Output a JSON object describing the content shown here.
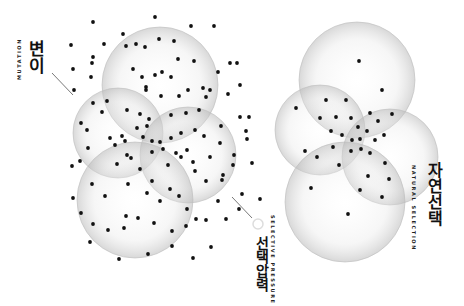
{
  "labels": {
    "mutation": {
      "ko": "변이",
      "en": "MUTATION"
    },
    "selective_pressure": {
      "ko": "선택압력",
      "en": "SELECTIVE PRESSURE"
    },
    "natural_selection": {
      "ko": "자연선택",
      "en": "NATURAL SELECTION"
    }
  },
  "colors": {
    "dot": "#111111",
    "bubble_edge": "#bdbdbd",
    "bubble_fill": "#f2f2f2",
    "leader": "#555555"
  },
  "left_cluster": {
    "circles": [
      {
        "cx": 160,
        "cy": 85,
        "r": 58
      },
      {
        "cx": 118,
        "cy": 133,
        "r": 45
      },
      {
        "cx": 188,
        "cy": 155,
        "r": 48
      },
      {
        "cx": 135,
        "cy": 200,
        "r": 58
      }
    ],
    "dots": [
      [
        93,
        22
      ],
      [
        155,
        17
      ],
      [
        123,
        34
      ],
      [
        104,
        44
      ],
      [
        71,
        45
      ],
      [
        191,
        26
      ],
      [
        214,
        26
      ],
      [
        93,
        57
      ],
      [
        126,
        46
      ],
      [
        73,
        69
      ],
      [
        92,
        63
      ],
      [
        136,
        44
      ],
      [
        145,
        47
      ],
      [
        159,
        39
      ],
      [
        174,
        41
      ],
      [
        178,
        59
      ],
      [
        194,
        61
      ],
      [
        230,
        63
      ],
      [
        237,
        63
      ],
      [
        91,
        77
      ],
      [
        74,
        90
      ],
      [
        142,
        77
      ],
      [
        133,
        69
      ],
      [
        146,
        87
      ],
      [
        155,
        75
      ],
      [
        162,
        72
      ],
      [
        171,
        77
      ],
      [
        218,
        72
      ],
      [
        240,
        85
      ],
      [
        93,
        103
      ],
      [
        107,
        101
      ],
      [
        146,
        90
      ],
      [
        161,
        96
      ],
      [
        179,
        96
      ],
      [
        188,
        90
      ],
      [
        203,
        88
      ],
      [
        210,
        90
      ],
      [
        228,
        94
      ],
      [
        81,
        123
      ],
      [
        102,
        112
      ],
      [
        127,
        110
      ],
      [
        140,
        114
      ],
      [
        149,
        119
      ],
      [
        171,
        115
      ],
      [
        186,
        113
      ],
      [
        199,
        110
      ],
      [
        206,
        97
      ],
      [
        110,
        138
      ],
      [
        122,
        136
      ],
      [
        143,
        137
      ],
      [
        152,
        141
      ],
      [
        171,
        138
      ],
      [
        181,
        133
      ],
      [
        195,
        130
      ],
      [
        204,
        136
      ],
      [
        221,
        126
      ],
      [
        240,
        117
      ],
      [
        249,
        117
      ],
      [
        246,
        131
      ],
      [
        87,
        130
      ],
      [
        88,
        148
      ],
      [
        137,
        128
      ],
      [
        147,
        126
      ],
      [
        115,
        145
      ],
      [
        125,
        141
      ],
      [
        127,
        155
      ],
      [
        160,
        142
      ],
      [
        163,
        149
      ],
      [
        176,
        153
      ],
      [
        187,
        150
      ],
      [
        193,
        162
      ],
      [
        210,
        157
      ],
      [
        220,
        143
      ],
      [
        234,
        155
      ],
      [
        80,
        161
      ],
      [
        72,
        166
      ],
      [
        117,
        164
      ],
      [
        131,
        158
      ],
      [
        140,
        169
      ],
      [
        152,
        152
      ],
      [
        168,
        165
      ],
      [
        181,
        157
      ],
      [
        195,
        171
      ],
      [
        206,
        181
      ],
      [
        223,
        175
      ],
      [
        242,
        194
      ],
      [
        252,
        163
      ],
      [
        73,
        198
      ],
      [
        92,
        184
      ],
      [
        105,
        196
      ],
      [
        128,
        184
      ],
      [
        126,
        216
      ],
      [
        147,
        193
      ],
      [
        152,
        181
      ],
      [
        160,
        201
      ],
      [
        170,
        189
      ],
      [
        179,
        196
      ],
      [
        187,
        209
      ],
      [
        196,
        219
      ],
      [
        218,
        201
      ],
      [
        226,
        219
      ],
      [
        233,
        165
      ],
      [
        247,
        139
      ],
      [
        81,
        213
      ],
      [
        93,
        224
      ],
      [
        108,
        230
      ],
      [
        124,
        228
      ],
      [
        138,
        218
      ],
      [
        154,
        223
      ],
      [
        172,
        231
      ],
      [
        186,
        226
      ],
      [
        206,
        220
      ],
      [
        211,
        247
      ],
      [
        193,
        258
      ],
      [
        172,
        246
      ],
      [
        119,
        259
      ],
      [
        90,
        242
      ],
      [
        148,
        254
      ],
      [
        222,
        180
      ],
      [
        239,
        209
      ],
      [
        260,
        199
      ]
    ]
  },
  "right_cluster": {
    "circles": [
      {
        "cx": 357,
        "cy": 80,
        "r": 58
      },
      {
        "cx": 320,
        "cy": 130,
        "r": 45
      },
      {
        "cx": 390,
        "cy": 157,
        "r": 48
      },
      {
        "cx": 345,
        "cy": 202,
        "r": 60
      }
    ],
    "dots": [
      [
        359,
        61
      ],
      [
        382,
        90
      ],
      [
        296,
        108
      ],
      [
        326,
        100
      ],
      [
        346,
        100
      ],
      [
        320,
        118
      ],
      [
        336,
        117
      ],
      [
        351,
        118
      ],
      [
        370,
        113
      ],
      [
        392,
        114
      ],
      [
        378,
        121
      ],
      [
        331,
        131
      ],
      [
        342,
        135
      ],
      [
        358,
        127
      ],
      [
        367,
        131
      ],
      [
        360,
        139
      ],
      [
        352,
        140
      ],
      [
        384,
        135
      ],
      [
        361,
        149
      ],
      [
        375,
        140
      ],
      [
        305,
        151
      ],
      [
        333,
        147
      ],
      [
        317,
        157
      ],
      [
        351,
        151
      ],
      [
        370,
        153
      ],
      [
        339,
        165
      ],
      [
        385,
        163
      ],
      [
        311,
        188
      ],
      [
        368,
        176
      ],
      [
        389,
        179
      ],
      [
        360,
        190
      ],
      [
        382,
        197
      ],
      [
        348,
        214
      ]
    ]
  }
}
